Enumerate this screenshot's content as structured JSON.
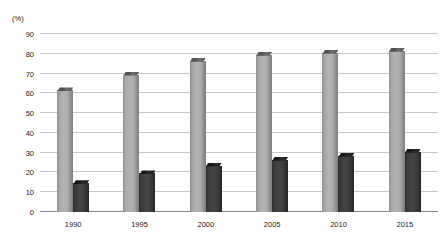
{
  "chart_data": {
    "type": "bar",
    "title": "",
    "subtitle": "",
    "xlabel": "",
    "ylabel": "",
    "y_unit_label": "(%)",
    "categories": [
      "1990",
      "1995",
      "2000",
      "2005",
      "2010",
      "2015"
    ],
    "series": [
      {
        "name": "series-1",
        "color": "#adadad",
        "values": [
          63,
          71,
          78,
          81,
          82,
          83
        ]
      },
      {
        "name": "series-2",
        "color": "#3c3c3c",
        "values": [
          16,
          21,
          25,
          28,
          30,
          32
        ]
      }
    ],
    "ylim": [
      0,
      90
    ],
    "y_ticks": [
      "0",
      "10",
      "20",
      "30",
      "40",
      "50",
      "60",
      "70",
      "80",
      "90"
    ],
    "y_tick_values": [
      0,
      10,
      20,
      30,
      40,
      50,
      60,
      70,
      80,
      90
    ],
    "grid": true,
    "legend": "none",
    "legend_position": "none",
    "annotations": []
  }
}
